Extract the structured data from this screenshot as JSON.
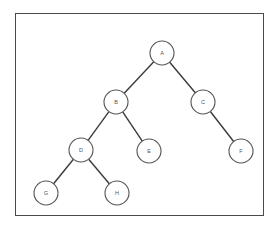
{
  "diagram": {
    "type": "binary-tree",
    "node_radius": 12,
    "colors": {
      "border": "#4a4a4a",
      "edge": "#3a3a3a",
      "node_stroke": "#555555",
      "label": "#555555",
      "background": "#ffffff"
    },
    "nodes": [
      {
        "id": "A",
        "label": "A",
        "x": 162,
        "y": 53
      },
      {
        "id": "B",
        "label": "B",
        "x": 116,
        "y": 102
      },
      {
        "id": "C",
        "label": "C",
        "x": 203,
        "y": 102
      },
      {
        "id": "D",
        "label": "D",
        "x": 81,
        "y": 150
      },
      {
        "id": "E",
        "label": "E",
        "x": 149,
        "y": 151
      },
      {
        "id": "F",
        "label": "F",
        "x": 241,
        "y": 151
      },
      {
        "id": "G",
        "label": "G",
        "x": 46,
        "y": 193
      },
      {
        "id": "H",
        "label": "H",
        "x": 117,
        "y": 193
      }
    ],
    "edges": [
      {
        "from": "A",
        "to": "B"
      },
      {
        "from": "A",
        "to": "C"
      },
      {
        "from": "B",
        "to": "D"
      },
      {
        "from": "B",
        "to": "E"
      },
      {
        "from": "C",
        "to": "F"
      },
      {
        "from": "D",
        "to": "G"
      },
      {
        "from": "D",
        "to": "H"
      }
    ]
  }
}
